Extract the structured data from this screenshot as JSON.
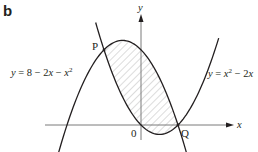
{
  "panel_label": "b",
  "axes": {
    "x_label": "x",
    "y_label": "y",
    "origin_label": "0"
  },
  "curves": [
    {
      "id": "downward",
      "equation": "y = 8 − 2x − x²",
      "label_text": "y = 8 − 2x − x",
      "label_sup": "2"
    },
    {
      "id": "upward",
      "equation": "y = x² − 2x",
      "label_text": "y = x",
      "label_sup": "2",
      "label_rest": " − 2x"
    }
  ],
  "points": {
    "P": {
      "label": "P",
      "x": -2,
      "y": 8
    },
    "Q": {
      "label": "Q",
      "x": 2,
      "y": 0
    }
  },
  "shaded_region": "area enclosed between the two curves from P to Q",
  "colors": {
    "line": "#231f20",
    "axis": "#7a7a7a",
    "hatch": "#9a9a9a"
  }
}
